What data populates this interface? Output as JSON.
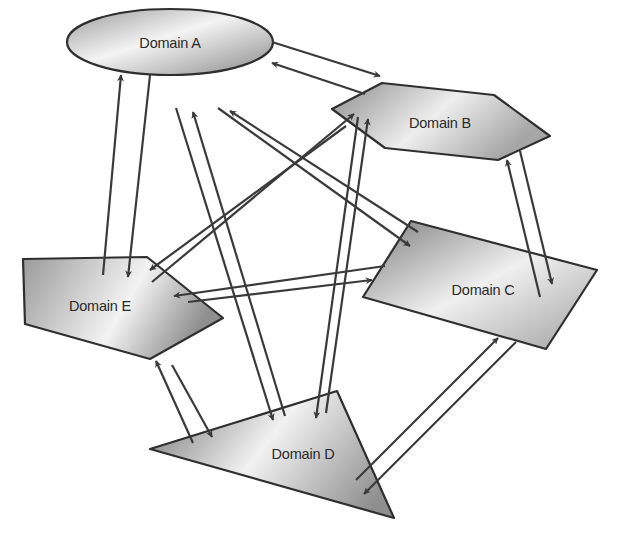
{
  "diagram": {
    "type": "network",
    "nodes": [
      {
        "id": "A",
        "label": "Domain A",
        "shape": "ellipse"
      },
      {
        "id": "B",
        "label": "Domain B",
        "shape": "hexagon"
      },
      {
        "id": "C",
        "label": "Domain C",
        "shape": "parallelogram"
      },
      {
        "id": "D",
        "label": "Domain D",
        "shape": "triangle"
      },
      {
        "id": "E",
        "label": "Domain E",
        "shape": "pentagon"
      }
    ],
    "edges": [
      {
        "from": "A",
        "to": "B"
      },
      {
        "from": "B",
        "to": "A"
      },
      {
        "from": "A",
        "to": "C"
      },
      {
        "from": "C",
        "to": "A"
      },
      {
        "from": "A",
        "to": "D"
      },
      {
        "from": "D",
        "to": "A"
      },
      {
        "from": "A",
        "to": "E"
      },
      {
        "from": "E",
        "to": "A"
      },
      {
        "from": "B",
        "to": "C"
      },
      {
        "from": "C",
        "to": "B"
      },
      {
        "from": "B",
        "to": "D"
      },
      {
        "from": "D",
        "to": "B"
      },
      {
        "from": "B",
        "to": "E"
      },
      {
        "from": "E",
        "to": "B"
      },
      {
        "from": "C",
        "to": "D"
      },
      {
        "from": "D",
        "to": "C"
      },
      {
        "from": "C",
        "to": "E"
      },
      {
        "from": "E",
        "to": "C"
      },
      {
        "from": "D",
        "to": "E"
      },
      {
        "from": "E",
        "to": "D"
      }
    ],
    "colors": {
      "stroke": "#2f2f2f",
      "fill_dark": "#8c8c8c",
      "fill_light": "#f2f2f2",
      "edge": "#3a3a3a"
    }
  }
}
